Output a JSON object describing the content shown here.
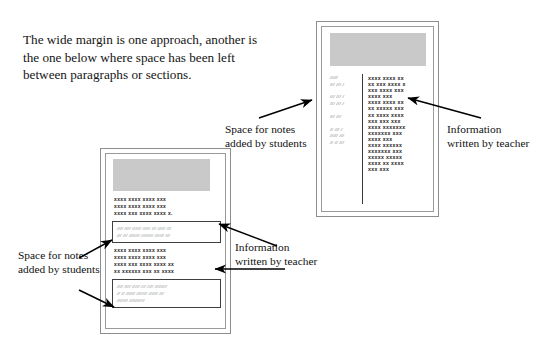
{
  "intro": {
    "text": "The wide margin is one approach, another is the one below where space has been left between paragraphs or sections."
  },
  "captions": {
    "notes_top": "Space for notes added by students",
    "info_top": "Information written by teacher",
    "notes_bottom": "Space for notes added by students",
    "info_bottom": "Information written by teacher"
  },
  "colors": {
    "header_block": "#c9c9c9",
    "page_border": "#8d8d8d",
    "note_box_border": "#3f3f3f",
    "text": "#111111",
    "background": "#ffffff"
  },
  "page_top": {
    "layout": "wide-margin",
    "margin_marks": [
      "/////",
      "/// /// /",
      "",
      "/// /// /",
      "/// /// /",
      "",
      "/// ///",
      "",
      "// /// /",
      "///// ///",
      "// // ///"
    ],
    "body_lines": [
      "xxxx xxxx xx",
      "xx xxx xxxx x",
      "xxx xxxx xxx",
      "xxxx xxx",
      "xxxx xxxx xx",
      "xx xxxxx xxx",
      "xx xxxx xxxx",
      "xxx xxx xxx",
      "xxxx xxxxxxx",
      "xxxxxxx xxx",
      "xxxx xxx",
      "xxxx xxxxxx",
      "xxxxxxx xxx",
      "xxxxx xxxxx",
      "xxxx xx xxxx",
      "xxx  xxx"
    ]
  },
  "page_bottom": {
    "layout": "space-between-paragraphs",
    "blocks": [
      {
        "kind": "paragraph",
        "lines": [
          "xxxx xxxx xxxx xxx",
          "xxxx xxxx xxxx xxx",
          "xxxx xxx xxxx xxxx x."
        ]
      },
      {
        "kind": "note_box",
        "lines": [
          "//// //// ////// ///// /// ///// ///",
          "/// /// /////// //////// ////// ///"
        ]
      },
      {
        "kind": "paragraph",
        "lines": [
          "xxxx xxxx xxxx xxx",
          "xxxx xxxx xxxx xxx",
          "xxxx xxx xxxx xxxx xx",
          "xx xxxxxx xxx xx xxxx"
        ]
      },
      {
        "kind": "note_box",
        "lines": [
          "//// //// ///// /// //// ////////",
          "// // ////// /////// ////// ///",
          "/////// //////////"
        ]
      }
    ]
  }
}
